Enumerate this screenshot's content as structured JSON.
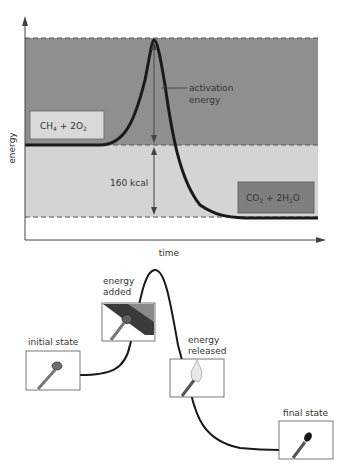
{
  "top_chart": {
    "y_axis_label": "energy",
    "x_axis_label": "time",
    "reactants_label": "CH4 + 2O2",
    "reactants": {
      "base1": "CH",
      "sub1": "4",
      "mid": " + 2O",
      "sub2": "2"
    },
    "products_label": "CO2 + 2H2O",
    "products": {
      "base1": "CO",
      "sub1": "2",
      "mid": " + 2H",
      "sub2": "2",
      "end": "O"
    },
    "activation_label_line1": "activation",
    "activation_label_line2": "energy",
    "delta_label": "160 kcal",
    "colors": {
      "high_band": "#8f8f8f",
      "mid_band": "#d4d4d4",
      "curve": "#1a1a1a",
      "reactant_box": "#d9d9d9",
      "product_box": "#7f7f7f"
    }
  },
  "bottom_diagram": {
    "states": [
      {
        "id": "initial",
        "label": "initial state"
      },
      {
        "id": "added",
        "label_line1": "energy",
        "label_line2": "added"
      },
      {
        "id": "released",
        "label_line1": "energy",
        "label_line2": "released"
      },
      {
        "id": "final",
        "label": "final state"
      }
    ]
  }
}
